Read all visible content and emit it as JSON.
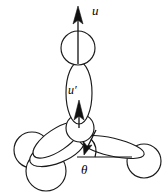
{
  "figure": {
    "caption_title": "Molecular orientation schematic",
    "background_color": "#ffffff",
    "stroke_color": "#1a1a1a",
    "fill_color": "#ffffff",
    "width": 164,
    "height": 194
  },
  "labels": {
    "top_vector": "u",
    "inner_vector": "u′",
    "angle": "θ"
  },
  "annotations": {
    "top_vector_name": "u",
    "inner_vector_name": "u-prime",
    "angle_name": "theta"
  },
  "geometry": {
    "top_sphere": {
      "cx": 78,
      "cy": 48,
      "r": 17
    },
    "vertical_lobe": {
      "cx": 79,
      "cy": 92,
      "rx": 13,
      "ry": 30
    },
    "center_sphere": {
      "cx": 80,
      "cy": 128,
      "r": 14
    },
    "right_sphere": {
      "cx": 144,
      "cy": 161,
      "r": 17
    },
    "left_sphere_upper": {
      "cx": 32,
      "cy": 150,
      "r": 18
    },
    "left_sphere_lower": {
      "cx": 46,
      "cy": 170,
      "r": 20
    },
    "right_lobe": {
      "cx": 112,
      "cy": 146,
      "rx": 32,
      "ry": 9,
      "rotate": 12
    },
    "left_lobe_upper": {
      "cx": 56,
      "cy": 139,
      "rx": 27,
      "ry": 11,
      "rotate": -32
    },
    "left_lobe_lower": {
      "cx": 57,
      "cy": 150,
      "rx": 28,
      "ry": 12,
      "rotate": -22
    },
    "top_vector_line": {
      "x1": 78,
      "y1": 60,
      "x2": 78,
      "y2": 12
    },
    "inner_vector_line": {
      "x1": 79,
      "y1": 122,
      "x2": 79,
      "y2": 100
    },
    "angle_vector_line": {
      "x1": 94,
      "y1": 134,
      "x2": 85,
      "y2": 152
    },
    "baseline": {
      "x1": 76,
      "y1": 157,
      "x2": 130,
      "y2": 157
    },
    "angle_arc_radius": 17
  },
  "label_positions": {
    "top_vector": {
      "x": 92,
      "y": 14
    },
    "inner_vector": {
      "x": 70,
      "y": 96
    },
    "angle": {
      "x": 83,
      "y": 177
    }
  }
}
